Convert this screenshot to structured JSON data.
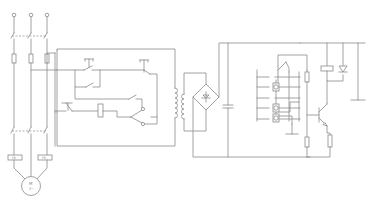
{
  "diagram": {
    "title": "",
    "type": "electrical-schematic",
    "stroke_color": "#8a8a8a",
    "background": "#ffffff",
    "sections": [
      {
        "id": "power-circuit",
        "description": "three-phase supply, breaker, fuses, main contactor, thermal relays, motor"
      },
      {
        "id": "control-circuit",
        "description": "start/stop pushbuttons, contactor coil, selector switch"
      },
      {
        "id": "transformer-rectifier",
        "description": "control transformer, bridge rectifier, filter capacitor"
      },
      {
        "id": "level-sensor-circuit",
        "description": "electrode probes, relay contact, transistor switch, relay coil with diode, ground"
      }
    ],
    "motor_label": "M 3~",
    "thermal_relay_labels": [
      "FR",
      "FR"
    ]
  },
  "geometry": {
    "phases_x": [
      14,
      31,
      47
    ],
    "terminal_y": 16,
    "breaker_y": 36,
    "fuse_y": 58,
    "contactor_y": 131,
    "motor": {
      "cx": 31,
      "cy": 186,
      "r": 10
    },
    "thermal_relays": [
      {
        "x": 8,
        "y": 155,
        "w": 14,
        "h": 5
      },
      {
        "x": 38,
        "y": 155,
        "w": 14,
        "h": 5
      }
    ],
    "transformer": {
      "x": 177,
      "y": 94
    },
    "bridge": {
      "cx": 206,
      "cy": 97,
      "r": 13
    },
    "capacitor_x": 228
  }
}
